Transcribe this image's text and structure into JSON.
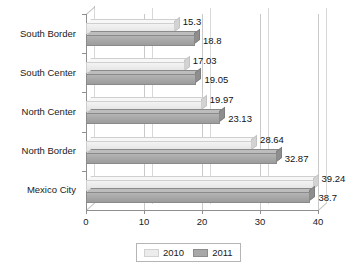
{
  "chart_data": {
    "type": "bar",
    "orientation": "horizontal",
    "title": "",
    "subtitle": "",
    "xlabel": "",
    "ylabel": "",
    "categories": [
      "South Border",
      "South Center",
      "North Center",
      "North Border",
      "Mexico City"
    ],
    "series": [
      {
        "name": "2010",
        "color": "#ececec",
        "values": [
          15.3,
          17.03,
          19.97,
          28.64,
          39.24
        ]
      },
      {
        "name": "2011",
        "color": "#a8a8a8",
        "values": [
          18.8,
          19.05,
          23.13,
          32.87,
          38.7
        ]
      }
    ],
    "value_labels": [
      {
        "category": "South Border",
        "2010": "15.3",
        "2011": "18.8"
      },
      {
        "category": "South Center",
        "2010": "17.03",
        "2011": "19.05"
      },
      {
        "category": "North Center",
        "2010": "19.97",
        "2011": "23.13"
      },
      {
        "category": "North Border",
        "2010": "28.64",
        "2011": "32.87"
      },
      {
        "category": "Mexico City",
        "2010": "39.24",
        "2011": "38.7"
      }
    ],
    "xlim": [
      0,
      40
    ],
    "xticks": [
      "0",
      "10",
      "20",
      "30",
      "40"
    ],
    "grid": true,
    "grid_axis": "x",
    "legend": {
      "position": "bottom",
      "entries": [
        {
          "label": "2010",
          "swatch": "light-swatch"
        },
        {
          "label": "2011",
          "swatch": "dark-swatch"
        }
      ]
    },
    "style": "3d-horizontal-bar"
  },
  "axis": {
    "x_tick_0": "0",
    "x_tick_1": "10",
    "x_tick_2": "20",
    "x_tick_3": "30",
    "x_tick_4": "40"
  },
  "categories": {
    "c0": "South Border",
    "c1": "South Center",
    "c2": "North Center",
    "c3": "North Border",
    "c4": "Mexico City"
  },
  "values": {
    "g0_2010": "15.3",
    "g0_2011": "18.8",
    "g1_2010": "17.03",
    "g1_2011": "19.05",
    "g2_2010": "19.97",
    "g2_2011": "23.13",
    "g3_2010": "28.64",
    "g3_2011": "32.87",
    "g4_2010": "39.24",
    "g4_2011": "38.7"
  },
  "legend": {
    "series_2010": "2010",
    "series_2011": "2011"
  }
}
